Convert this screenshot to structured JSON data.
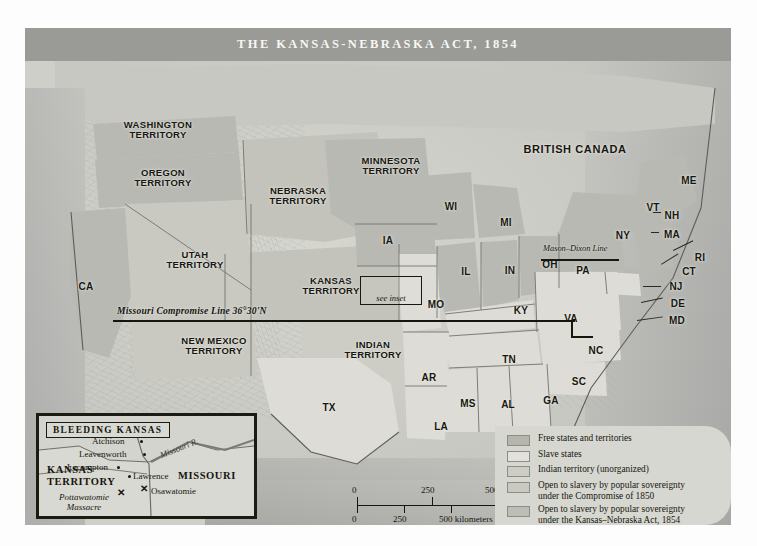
{
  "map": {
    "title": "THE KANSAS-NEBRASKA ACT, 1854",
    "canada_label": "BRITISH CANADA",
    "compromise_line_label": "Missouri Compromise Line 36°30'N",
    "mason_dixon_label": "Mason–Dixon Line",
    "see_inset_label": "see inset"
  },
  "territories": [
    {
      "name": "washington-territory",
      "label": "WASHINGTON\nTERRITORY",
      "x": 78,
      "y": 92,
      "w": 110
    },
    {
      "name": "oregon-territory",
      "label": "OREGON\nTERRITORY",
      "x": 86,
      "y": 140,
      "w": 104
    },
    {
      "name": "utah-territory",
      "label": "UTAH\nTERRITORY",
      "x": 120,
      "y": 222,
      "w": 100
    },
    {
      "name": "new-mexico-territory",
      "label": "NEW MEXICO\nTERRITORY",
      "x": 132,
      "y": 308,
      "w": 114
    },
    {
      "name": "nebraska-territory",
      "label": "NEBRASKA\nTERRITORY",
      "x": 218,
      "y": 158,
      "w": 110
    },
    {
      "name": "minnesota-territory",
      "label": "MINNESOTA\nTERRITORY",
      "x": 312,
      "y": 128,
      "w": 108
    },
    {
      "name": "kansas-territory",
      "label": "KANSAS\nTERRITORY",
      "x": 254,
      "y": 248,
      "w": 104
    },
    {
      "name": "indian-territory",
      "label": "INDIAN\nTERRITORY",
      "x": 296,
      "y": 312,
      "w": 104
    }
  ],
  "states": [
    {
      "name": "california",
      "label": "CA",
      "x": 48,
      "y": 254
    },
    {
      "name": "texas",
      "label": "TX",
      "x": 291,
      "y": 375
    },
    {
      "name": "iowa",
      "label": "IA",
      "x": 350,
      "y": 208
    },
    {
      "name": "wisconsin",
      "label": "WI",
      "x": 413,
      "y": 174
    },
    {
      "name": "michigan",
      "label": "MI",
      "x": 468,
      "y": 190
    },
    {
      "name": "illinois",
      "label": "IL",
      "x": 428,
      "y": 239
    },
    {
      "name": "indiana",
      "label": "IN",
      "x": 472,
      "y": 238
    },
    {
      "name": "ohio",
      "label": "OH",
      "x": 512,
      "y": 232
    },
    {
      "name": "missouri",
      "label": "MO",
      "x": 398,
      "y": 272
    },
    {
      "name": "kentucky",
      "label": "KY",
      "x": 483,
      "y": 278
    },
    {
      "name": "tennessee",
      "label": "TN",
      "x": 471,
      "y": 327
    },
    {
      "name": "arkansas",
      "label": "AR",
      "x": 391,
      "y": 345
    },
    {
      "name": "louisiana",
      "label": "LA",
      "x": 403,
      "y": 394
    },
    {
      "name": "mississippi",
      "label": "MS",
      "x": 430,
      "y": 371
    },
    {
      "name": "alabama",
      "label": "AL",
      "x": 470,
      "y": 372
    },
    {
      "name": "georgia",
      "label": "GA",
      "x": 513,
      "y": 368
    },
    {
      "name": "florida",
      "label": "FL",
      "x": 537,
      "y": 413
    },
    {
      "name": "south-carolina",
      "label": "SC",
      "x": 541,
      "y": 349
    },
    {
      "name": "north-carolina",
      "label": "NC",
      "x": 558,
      "y": 318
    },
    {
      "name": "virginia",
      "label": "VA",
      "x": 533,
      "y": 286
    },
    {
      "name": "pennsylvania",
      "label": "PA",
      "x": 545,
      "y": 238
    },
    {
      "name": "new-york",
      "label": "NY",
      "x": 585,
      "y": 203
    },
    {
      "name": "maine",
      "label": "ME",
      "x": 651,
      "y": 148
    },
    {
      "name": "vermont",
      "label": "VT",
      "x": 615,
      "y": 175
    },
    {
      "name": "new-hampshire",
      "label": "NH",
      "x": 634,
      "y": 183
    },
    {
      "name": "massachusetts",
      "label": "MA",
      "x": 634,
      "y": 202
    },
    {
      "name": "rhode-island",
      "label": "RI",
      "x": 662,
      "y": 225
    },
    {
      "name": "connecticut",
      "label": "CT",
      "x": 651,
      "y": 239
    },
    {
      "name": "new-jersey",
      "label": "NJ",
      "x": 638,
      "y": 254
    },
    {
      "name": "delaware",
      "label": "DE",
      "x": 640,
      "y": 271
    },
    {
      "name": "maryland",
      "label": "MD",
      "x": 639,
      "y": 288
    }
  ],
  "legend": {
    "items": [
      {
        "name": "free-states",
        "label": "Free states and territories",
        "swatch": "sw-free"
      },
      {
        "name": "slave-states",
        "label": "Slave states",
        "swatch": "sw-slave"
      },
      {
        "name": "indian-territory",
        "label": "Indian territory (unorganized)",
        "swatch": "sw-indian"
      },
      {
        "name": "popular-sovereignty-1850",
        "label": "Open to slavery by popular sovereignty\nunder the Compromise of 1850",
        "swatch": "sw-p1850"
      },
      {
        "name": "popular-sovereignty-kna",
        "label": "Open to slavery by popular sovereignty\nunder the Kansas–Nebraska Act, 1854",
        "swatch": "sw-pkn"
      }
    ]
  },
  "inset": {
    "title": "BLEEDING KANSAS",
    "state_labels": [
      {
        "name": "kansas-territory",
        "label": "KANSAS\nTERRITORY",
        "x": 8,
        "y": 48
      },
      {
        "name": "missouri",
        "label": "MISSOURI",
        "x": 139,
        "y": 54
      }
    ],
    "cities": [
      {
        "name": "atchison",
        "label": "Atchison",
        "lx": 53,
        "ly": 20,
        "dx": 101,
        "dy": 24
      },
      {
        "name": "leavenworth",
        "label": "Leavenworth",
        "lx": 40,
        "ly": 33,
        "dx": 104,
        "dy": 37
      },
      {
        "name": "lecompton",
        "label": "Lecompton",
        "lx": 28,
        "ly": 46,
        "dx": 78,
        "dy": 50
      },
      {
        "name": "lawrence",
        "label": "Lawrence",
        "lx": 94,
        "ly": 55,
        "dx": 89,
        "dy": 59
      }
    ],
    "battles": [
      {
        "name": "osawatomie",
        "label": "Osawatomie",
        "lx": 112,
        "ly": 70,
        "mx": 101,
        "my": 68
      },
      {
        "name": "pottawatomie-massacre",
        "label": "Pottawatomie\nMassacre",
        "lx": 20,
        "ly": 76,
        "mx": 78,
        "my": 72
      }
    ],
    "river_label": "Missouri R."
  },
  "scale": {
    "miles_label": "500 miles",
    "km_label": "500 kilometers",
    "miles_mid": "250",
    "km_mid": "250",
    "zero_top": "0",
    "zero_bottom": "0"
  }
}
